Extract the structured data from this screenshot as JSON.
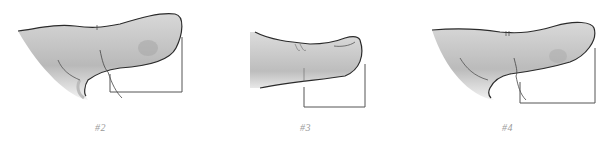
{
  "figures": [
    {
      "label": "#2",
      "subject": "thumb-illustration-side-view-bent"
    },
    {
      "label": "#3",
      "subject": "thumb-illustration-side-view-straight"
    },
    {
      "label": "#4",
      "subject": "thumb-illustration-side-view-hyperextended"
    }
  ],
  "colors": {
    "outline": "#2b2b2b",
    "shade": "#b8b8b8",
    "bracket": "#555555",
    "label": "#9a9a9a"
  }
}
